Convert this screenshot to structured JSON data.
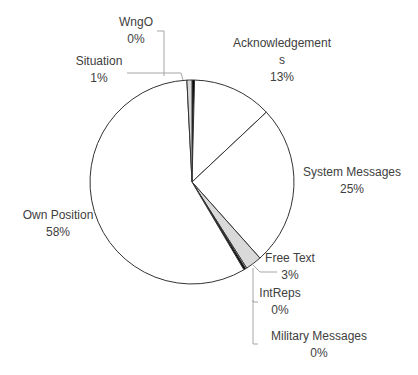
{
  "chart_data": {
    "type": "pie",
    "title": "",
    "start": "top",
    "direction": "clockwise",
    "slices": [
      {
        "label": "WngO",
        "value": 0.4,
        "display": "0%",
        "fill": "#000000"
      },
      {
        "label": "Acknowledgements",
        "label_lines": [
          "Acknowledgement",
          "s"
        ],
        "value": 12.6,
        "display": "13%",
        "fill": "#ffffff"
      },
      {
        "label": "System Messages",
        "value": 25.4,
        "display": "25%",
        "fill": "#ffffff"
      },
      {
        "label": "Free Text",
        "value": 2.6,
        "display": "3%",
        "fill": "#d9d9d9"
      },
      {
        "label": "IntReps",
        "value": 0.2,
        "display": "0%",
        "fill": "#ffffff"
      },
      {
        "label": "Military Messages",
        "value": 0.3,
        "display": "0%",
        "fill": "#000000"
      },
      {
        "label": "Own Position",
        "value": 57.7,
        "display": "58%",
        "fill": "#ffffff"
      },
      {
        "label": "Situation",
        "value": 0.8,
        "display": "1%",
        "fill": "#d9d9d9"
      }
    ],
    "legend": "none",
    "outline_color": "#333333",
    "label_color": "#404040"
  }
}
